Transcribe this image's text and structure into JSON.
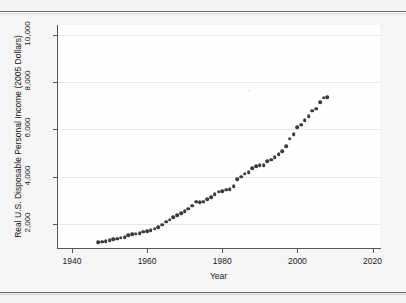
{
  "figure": {
    "background_color": "#f4f4f4",
    "plot_background_color": "#fefefe",
    "rule_color": "#6a6a6a",
    "marker_color": "#3a3a3f",
    "gridline_color": "#e8e8e8",
    "axis_color": "#555555"
  },
  "chart_data": {
    "type": "scatter",
    "title": "",
    "subtitle": "",
    "xlabel": "Year",
    "ylabel": "Real U.S. Disposable Personal Income (2005 Dollars)",
    "xlim": [
      1936,
      2022
    ],
    "ylim": [
      1000,
      10400
    ],
    "xticks": [
      1940,
      1960,
      1980,
      2000,
      2020
    ],
    "xtick_labels": [
      "1940",
      "1960",
      "1980",
      "2000",
      "2020"
    ],
    "yticks": [
      2000,
      4000,
      6000,
      8000,
      10000
    ],
    "ytick_labels": [
      "2,000",
      "4,000",
      "6,000",
      "8,000",
      "10,000"
    ],
    "grid": "horizontal",
    "legend": "none",
    "marker": "filled-circle",
    "annotations": [],
    "series": [
      {
        "name": "Real U.S. Disposable Personal Income",
        "x": [
          1947,
          1948,
          1949,
          1950,
          1951,
          1952,
          1953,
          1954,
          1955,
          1956,
          1957,
          1958,
          1959,
          1960,
          1961,
          1962,
          1963,
          1964,
          1965,
          1966,
          1967,
          1968,
          1969,
          1970,
          1971,
          1972,
          1973,
          1974,
          1975,
          1976,
          1977,
          1978,
          1979,
          1980,
          1981,
          1982,
          1983,
          1984,
          1985,
          1986,
          1987,
          1988,
          1989,
          1990,
          1991,
          1992,
          1993,
          1994,
          1995,
          1996,
          1997,
          1998,
          1999,
          2000,
          2001,
          2002,
          2003,
          2004,
          2005,
          2006,
          2007,
          2008
        ],
        "y": [
          1250,
          1270,
          1280,
          1330,
          1370,
          1400,
          1440,
          1450,
          1530,
          1580,
          1610,
          1620,
          1680,
          1710,
          1750,
          1820,
          1870,
          1990,
          2100,
          2200,
          2290,
          2390,
          2460,
          2560,
          2650,
          2790,
          2950,
          2920,
          2960,
          3060,
          3140,
          3280,
          3380,
          3390,
          3450,
          3470,
          3600,
          3890,
          4010,
          4130,
          4200,
          4360,
          4460,
          4500,
          4490,
          4650,
          4720,
          4830,
          4950,
          5080,
          5280,
          5610,
          5800,
          6100,
          6200,
          6380,
          6560,
          6780,
          6870,
          7140,
          7330,
          7350
        ]
      }
    ],
    "note": "Scatter of annual real U.S. disposable personal income in 2005 dollars (billions), 1947-2008; values rise from about 1,250 to about 10,000 on the plotted axis scale."
  },
  "axis_labels": {
    "y_axis_title": "Real U.S. Disposable Personal Income (2005 Dollars)",
    "x_axis_title": "Year"
  }
}
